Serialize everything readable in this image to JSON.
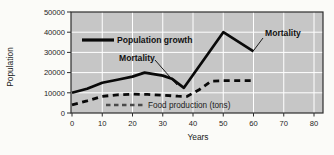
{
  "figure": {
    "background": "#fbfbf8",
    "plot_background": "#c6c6c6",
    "grid_color": "#ffffff",
    "border_color": "#2e2e2e",
    "line_color": "#0a0a0a",
    "food_legend_color": "#4a4a4a",
    "text_color": "#1c1c1c"
  },
  "chart_data": {
    "type": "line",
    "title": "",
    "xlabel": "Years",
    "ylabel": "Population",
    "xlim": [
      0,
      80
    ],
    "ylim": [
      0,
      50000
    ],
    "x_ticks": [
      0,
      10,
      20,
      30,
      40,
      50,
      60,
      70,
      80
    ],
    "y_ticks": [
      0,
      10000,
      20000,
      30000,
      40000,
      50000
    ],
    "grid": true,
    "legend_position": "inside-plot",
    "series": [
      {
        "name": "Population growth",
        "style": "solid",
        "points": [
          [
            0,
            10000
          ],
          [
            5,
            12000
          ],
          [
            10,
            15000
          ],
          [
            15,
            16500
          ],
          [
            20,
            18000
          ],
          [
            24,
            20000
          ],
          [
            30,
            18500
          ],
          [
            33,
            17000
          ],
          [
            37,
            12500
          ],
          [
            50,
            40000
          ],
          [
            60,
            30500
          ]
        ]
      },
      {
        "name": "Food production (tons)",
        "style": "dashed",
        "points": [
          [
            0,
            4000
          ],
          [
            5,
            6000
          ],
          [
            10,
            8200
          ],
          [
            15,
            9000
          ],
          [
            20,
            9300
          ],
          [
            25,
            9200
          ],
          [
            30,
            8800
          ],
          [
            35,
            8300
          ],
          [
            38,
            8200
          ],
          [
            42,
            11500
          ],
          [
            46,
            15800
          ],
          [
            50,
            16000
          ],
          [
            60,
            16000
          ]
        ]
      }
    ],
    "annotations": [
      {
        "text": "Mortality",
        "target": "dip of population growth line at ~37 years"
      },
      {
        "text": "Mortality",
        "target": "end of population growth line at ~60 years"
      }
    ],
    "legend": {
      "population_label": "Population growth",
      "food_label": "Food production (tons)"
    },
    "annotation_mid": "Mortality",
    "annotation_top": "Mortality"
  }
}
